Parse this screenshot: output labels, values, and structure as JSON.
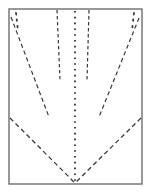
{
  "figure": {
    "title": "Folding pattern diagram",
    "background_color": "#ffffff",
    "line_color": "#3a3a3a",
    "frame_color": "#6e6e6e"
  },
  "canvas": {
    "width": 151,
    "height": 194
  },
  "frame": {
    "name": "panel-outline",
    "x": 9,
    "y": 9,
    "width": 133,
    "height": 175,
    "stroke_width": 1.4,
    "color": "#6e6e6e"
  },
  "fold_lines": [
    {
      "id": "center-vertical-fold",
      "label": "Center vertical fold",
      "style": "dotted",
      "dash": "1.6 4.2",
      "stroke_width": 1.9,
      "x1": 75,
      "y1": 11,
      "x2": 75,
      "y2": 183
    },
    {
      "id": "inner-left-vertical-fold",
      "label": "Inner left vertical fold",
      "style": "dashed",
      "dash": "3.4 2.6",
      "stroke_width": 1.2,
      "x1": 57,
      "y1": 10,
      "x2": 60,
      "y2": 80
    },
    {
      "id": "inner-right-vertical-fold",
      "label": "Inner right vertical fold",
      "style": "dashed",
      "dash": "3.4 2.6",
      "stroke_width": 1.2,
      "x1": 89,
      "y1": 10,
      "x2": 87,
      "y2": 80
    },
    {
      "id": "left-diagonal-fold",
      "label": "Left diagonal fold",
      "style": "dashed",
      "dash": "4.2 3.0",
      "stroke_width": 1.2,
      "x1": 11,
      "y1": 17,
      "x2": 49,
      "y2": 117
    },
    {
      "id": "right-diagonal-fold",
      "label": "Right diagonal fold",
      "style": "dashed",
      "dash": "4.2 3.0",
      "stroke_width": 1.2,
      "x1": 139,
      "y1": 18,
      "x2": 99,
      "y2": 117
    },
    {
      "id": "v-left-arm-fold",
      "label": "V left arm fold",
      "style": "dashed",
      "dash": "4.6 3.2",
      "stroke_width": 1.3,
      "x1": 10,
      "y1": 118,
      "x2": 75,
      "y2": 183
    },
    {
      "id": "v-right-arm-fold",
      "label": "V right arm fold",
      "style": "dashed",
      "dash": "4.6 3.2",
      "stroke_width": 1.3,
      "x1": 141,
      "y1": 118,
      "x2": 75,
      "y2": 183
    }
  ],
  "corner_marks": [
    {
      "id": "top-left-corner-dots",
      "label": "Top left corner dotted mark",
      "x1": 16,
      "y1": 13,
      "x2": 18,
      "y2": 31,
      "dash": "1.5 5",
      "stroke_width": 1.8
    },
    {
      "id": "top-right-corner-dots",
      "label": "Top right corner dotted mark",
      "x1": 134,
      "y1": 13,
      "x2": 132,
      "y2": 31,
      "dash": "1.5 5",
      "stroke_width": 1.8
    }
  ]
}
